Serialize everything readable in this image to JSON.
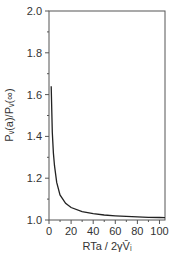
{
  "chart_data": {
    "type": "line",
    "title": "",
    "xlabel": "RTa / 2γV̄ᵢ",
    "ylabel": "Pᵥ(a)/Pᵥ(∞)",
    "xlim": [
      0,
      105
    ],
    "ylim": [
      1.0,
      2.0
    ],
    "x_ticks": [
      "0",
      "20",
      "40",
      "60",
      "80",
      "100"
    ],
    "y_ticks": [
      "1.0",
      "1.2",
      "1.4",
      "1.6",
      "1.8",
      "2.0"
    ],
    "grid": false,
    "legend": null,
    "series": [
      {
        "name": "Pv(a)/Pv(inf)",
        "x": [
          2,
          3,
          4,
          5,
          7,
          10,
          15,
          20,
          30,
          40,
          50,
          60,
          70,
          80,
          90,
          100,
          105
        ],
        "values": [
          1.64,
          1.42,
          1.32,
          1.26,
          1.18,
          1.12,
          1.08,
          1.06,
          1.04,
          1.03,
          1.024,
          1.02,
          1.017,
          1.015,
          1.013,
          1.012,
          1.011
        ]
      }
    ]
  }
}
